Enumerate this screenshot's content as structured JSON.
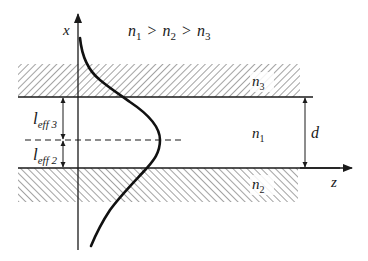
{
  "diagram": {
    "type": "slab-waveguide-mode-profile",
    "condition": {
      "parts": [
        {
          "base": "n",
          "sub": "1"
        },
        {
          "op": ">"
        },
        {
          "base": "n",
          "sub": "2"
        },
        {
          "op": ">"
        },
        {
          "base": "n",
          "sub": "3"
        }
      ]
    },
    "axes": {
      "vertical_label": "x",
      "horizontal_label": "z"
    },
    "regions": {
      "top_cladding": {
        "base": "n",
        "sub": "3",
        "style": "hatched"
      },
      "core": {
        "base": "n",
        "sub": "1"
      },
      "bottom_substrate": {
        "base": "n",
        "sub": "2",
        "style": "hatched"
      }
    },
    "dimensions": {
      "thickness_label": "d",
      "upper_effective": {
        "base": "l",
        "sub": "eff 3"
      },
      "lower_effective": {
        "base": "l",
        "sub": "eff 2"
      }
    },
    "colors": {
      "ink": "#1a1a1a",
      "hatch": "#555555",
      "background": "#ffffff"
    }
  }
}
